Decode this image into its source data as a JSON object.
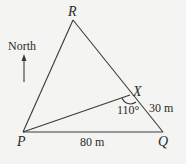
{
  "diagram": {
    "points": {
      "R": {
        "label": "R",
        "x": 73,
        "y": 20
      },
      "P": {
        "label": "P",
        "x": 23,
        "y": 132
      },
      "Q": {
        "label": "Q",
        "x": 163,
        "y": 132
      },
      "X": {
        "label": "X",
        "x": 130,
        "y": 95
      }
    },
    "segments": [
      [
        "R",
        "P"
      ],
      [
        "R",
        "Q"
      ],
      [
        "P",
        "Q"
      ],
      [
        "P",
        "X"
      ]
    ],
    "angle_label": "110°",
    "length_PQ": "80 m",
    "length_XQ": "30 m",
    "north_label": "North",
    "line_color": "#3a3a3a"
  }
}
